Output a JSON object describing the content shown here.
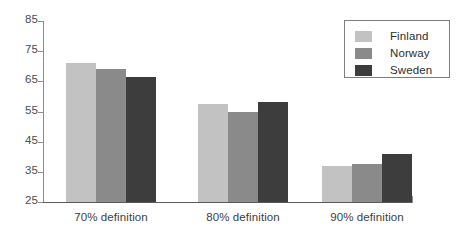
{
  "chart_data": {
    "type": "bar",
    "title": "",
    "subtitle": "",
    "xlabel": "",
    "ylabel": "",
    "categories": [
      "70% definition",
      "80% definition",
      "90% definition"
    ],
    "series": [
      {
        "name": "Finland",
        "color": "#c2c2c2",
        "values": [
          71,
          57.5,
          37
        ]
      },
      {
        "name": "Norway",
        "color": "#8a8a8a",
        "values": [
          69,
          55,
          37.5
        ]
      },
      {
        "name": "Sweden",
        "color": "#3d3d3d",
        "values": [
          66.5,
          58,
          41
        ]
      }
    ],
    "ylim": [
      25,
      85
    ],
    "ytick_step": 10,
    "yticks": [
      85,
      75,
      65,
      55,
      45,
      35,
      25
    ],
    "grid": false,
    "legend_position": "top-right",
    "bar_base_value": 25
  },
  "legend": {
    "items": [
      {
        "label": "Finland",
        "color": "#c2c2c2"
      },
      {
        "label": "Norway",
        "color": "#8a8a8a"
      },
      {
        "label": "Sweden",
        "color": "#3d3d3d"
      }
    ]
  },
  "axes": {
    "y_tick_labels": [
      "85",
      "75",
      "65",
      "55",
      "45",
      "35",
      "25"
    ],
    "x_tick_labels": [
      "70% definition",
      "80% definition",
      "90% definition"
    ]
  }
}
